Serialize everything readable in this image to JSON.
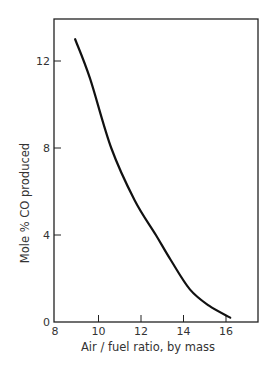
{
  "chart_data": {
    "type": "line",
    "title": "",
    "xlabel": "Air / fuel ratio,  by mass",
    "ylabel": "Mole % CO produced",
    "xlim": [
      8,
      17.5
    ],
    "ylim": [
      0,
      14
    ],
    "xticks": [
      8,
      10,
      12,
      14,
      16
    ],
    "yticks": [
      0,
      4,
      8,
      12
    ],
    "grid": false,
    "legend": null,
    "series": [
      {
        "name": "CO produced",
        "x": [
          8.9,
          9.6,
          10.6,
          11.7,
          12.7,
          13.4,
          14.3,
          15.2,
          16.2
        ],
        "y": [
          13.0,
          11.2,
          8.0,
          5.6,
          4.0,
          2.85,
          1.5,
          0.75,
          0.2
        ]
      }
    ]
  },
  "labels": {
    "x_ticks": [
      "8",
      "10",
      "12",
      "14",
      "16"
    ],
    "y_ticks": [
      "0",
      "4",
      "8",
      "12"
    ],
    "xlabel": "Air / fuel ratio,  by mass",
    "ylabel": "Mole % CO produced"
  }
}
